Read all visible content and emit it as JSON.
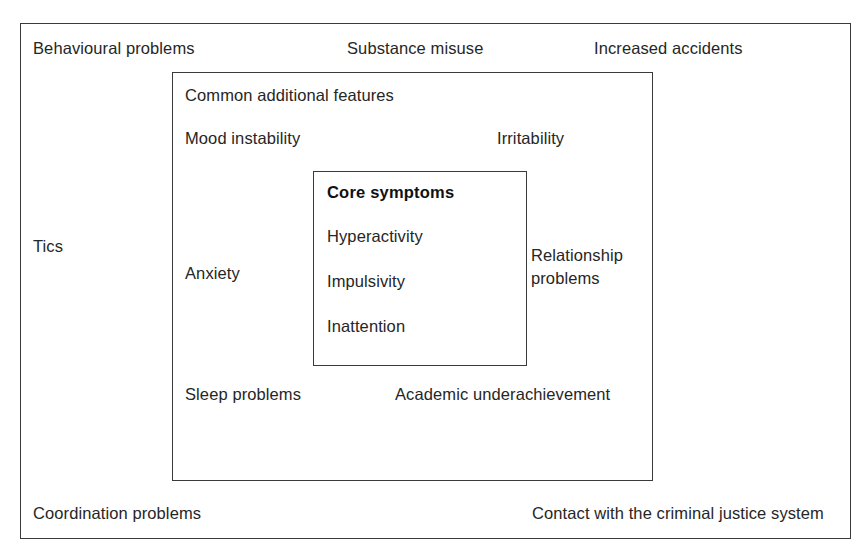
{
  "diagram": {
    "outer_ring": {
      "name": "Wider associated problems",
      "labels": [
        "Behavioural problems",
        "Substance misuse",
        "Increased accidents",
        "Tics",
        "Coordination problems",
        "Contact with the criminal justice system"
      ]
    },
    "middle_ring": {
      "heading": "Common additional features",
      "labels": [
        "Mood instability",
        "Irritability",
        "Anxiety",
        "Relationship problems",
        "Sleep problems",
        "Academic underachievement"
      ]
    },
    "inner_box": {
      "heading": "Core symptoms",
      "items": [
        "Hyperactivity",
        "Impulsivity",
        "Inattention"
      ]
    }
  },
  "colors": {
    "background": "#ffffff",
    "border": "#3a3a3a",
    "text": "#262626",
    "heading_text": "#111111"
  }
}
